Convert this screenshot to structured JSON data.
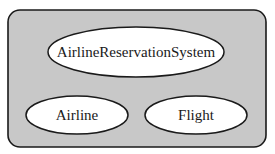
{
  "diagram": {
    "container": {
      "fill": "#c8c8c8",
      "stroke": "#1a1a1a"
    },
    "nodes": [
      {
        "id": "system",
        "label": "AirlineReservationSystem",
        "fill": "#ffffff"
      },
      {
        "id": "airline",
        "label": "Airline",
        "fill": "#ffffff"
      },
      {
        "id": "flight",
        "label": "Flight",
        "fill": "#ffffff"
      }
    ]
  }
}
